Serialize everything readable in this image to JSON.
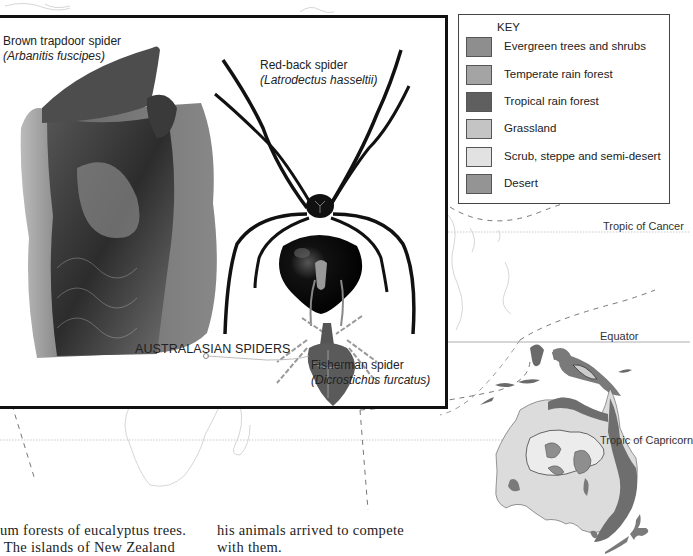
{
  "inset": {
    "title": "AUSTRALASIAN SPIDERS",
    "spiders": [
      {
        "common_name": "Brown trapdoor spider",
        "latin_name": "(Arbanitis fuscipes)"
      },
      {
        "common_name": "Red-back spider",
        "latin_name": "(Latrodectus hasseltii)"
      },
      {
        "common_name": "Fisherman spider",
        "latin_name": "(Dicrostichus furcatus)"
      }
    ]
  },
  "key": {
    "title": "KEY",
    "items": [
      {
        "label": "Evergreen trees and shrubs",
        "color": "#8e8e8e"
      },
      {
        "label": "Temperate rain forest",
        "color": "#a4a4a4"
      },
      {
        "label": "Tropical rain forest",
        "color": "#5f5f5f"
      },
      {
        "label": "Grassland",
        "color": "#c4c4c4"
      },
      {
        "label": "Scrub, steppe and semi-desert",
        "color": "#e2e2e2"
      },
      {
        "label": "Desert",
        "color": "#949494"
      }
    ]
  },
  "latitudes": {
    "cancer": "Tropic of Cancer",
    "equator": "Equator",
    "capricorn": "Tropic of Capricorn"
  },
  "body_text": {
    "col1_line1": "um forests of eucalyptus trees.",
    "col1_line2": " The islands of New Zealand",
    "col2_line1": "his animals arrived to compete",
    "col2_line2": "with them."
  }
}
